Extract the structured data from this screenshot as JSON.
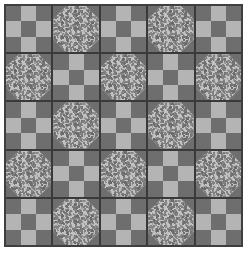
{
  "figure": {
    "name": "quilt-pattern",
    "width_px": 247,
    "height_px": 258,
    "background": "#ffffff",
    "margin_px": 4
  },
  "palette": {
    "dark_gray": "#6e6e6e",
    "light_gray": "#b4b4b4",
    "textured_base": "#c2c2c2",
    "textured_speckle": "#757575",
    "sashing": "#3a3a3a",
    "frame": "#3f3f3f",
    "page_background": "#ffffff"
  },
  "quilt": {
    "rows": 5,
    "columns": 5,
    "total_blocks": 25,
    "sashing_width_px": 2,
    "frame_width_px": 2,
    "block_types": [
      "ninepatch",
      "snowball"
    ],
    "layout_rule": "alternating checkerboard; ninepatch where (row+col) is even",
    "grid": [
      [
        "ninepatch",
        "snowball",
        "ninepatch",
        "snowball",
        "ninepatch"
      ],
      [
        "snowball",
        "ninepatch",
        "snowball",
        "ninepatch",
        "snowball"
      ],
      [
        "ninepatch",
        "snowball",
        "ninepatch",
        "snowball",
        "ninepatch"
      ],
      [
        "snowball",
        "ninepatch",
        "snowball",
        "ninepatch",
        "snowball"
      ],
      [
        "ninepatch",
        "snowball",
        "ninepatch",
        "snowball",
        "ninepatch"
      ]
    ],
    "ninepatch": {
      "label": "Nine-Patch block",
      "subdivisions": 9,
      "patches": [
        "dark",
        "light",
        "dark",
        "light",
        "dark",
        "light",
        "dark",
        "light",
        "dark"
      ]
    },
    "snowball": {
      "label": "Snowball block",
      "center_shape": "octagon",
      "center_fabric": "textured speckled gray",
      "corner_count": 4,
      "corner_fabric": "dark gray",
      "corner_fraction": 0.28
    }
  }
}
